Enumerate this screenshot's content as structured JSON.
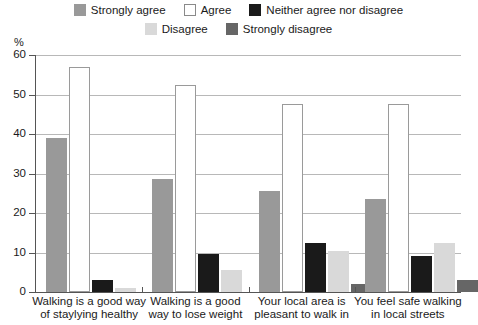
{
  "legend": {
    "rows": [
      [
        {
          "label": "Strongly agree",
          "color": "#999999",
          "swatch": "filled"
        },
        {
          "label": "Agree",
          "color": "#ffffff",
          "swatch": "outlined"
        },
        {
          "label": "Neither agree nor disagree",
          "color": "#1a1a1a",
          "swatch": "filled"
        }
      ],
      [
        {
          "label": "Disagree",
          "color": "#d9d9d9",
          "swatch": "filled"
        },
        {
          "label": "Strongly disagree",
          "color": "#666666",
          "swatch": "filled"
        }
      ]
    ]
  },
  "axis": {
    "y_unit": "%",
    "y_ticks": [
      "0",
      "10",
      "20",
      "30",
      "40",
      "50",
      "60"
    ]
  },
  "chart_data": {
    "type": "bar",
    "title": "",
    "xlabel": "",
    "ylabel": "%",
    "ylim": [
      0,
      60
    ],
    "ytick_step": 10,
    "grid": true,
    "legend_position": "top",
    "categories": [
      "Walking is a good way of staylying healthy",
      "Walking is a good way to lose weight",
      "Your local area is pleasant to walk in",
      "You feel safe walking in local streets"
    ],
    "category_lines": [
      [
        "Walking is a good way",
        "of staylying healthy"
      ],
      [
        "Walking is a good",
        "way to lose weight"
      ],
      [
        "Your local area is",
        "pleasant to walk in"
      ],
      [
        "You feel safe walking",
        "in local streets"
      ]
    ],
    "series": [
      {
        "name": "Strongly agree",
        "color": "#999999",
        "values": [
          39,
          28.5,
          25.5,
          23.5
        ]
      },
      {
        "name": "Agree",
        "color": "#ffffff",
        "values": [
          57,
          52.5,
          47.5,
          47.5
        ]
      },
      {
        "name": "Neither agree nor disagree",
        "color": "#1a1a1a",
        "values": [
          3,
          9.5,
          12.5,
          9
        ]
      },
      {
        "name": "Disagree",
        "color": "#d9d9d9",
        "values": [
          1,
          5.5,
          10.5,
          12.5
        ]
      },
      {
        "name": "Strongly disagree",
        "color": "#666666",
        "values": [
          0,
          0,
          2,
          3
        ]
      }
    ]
  }
}
